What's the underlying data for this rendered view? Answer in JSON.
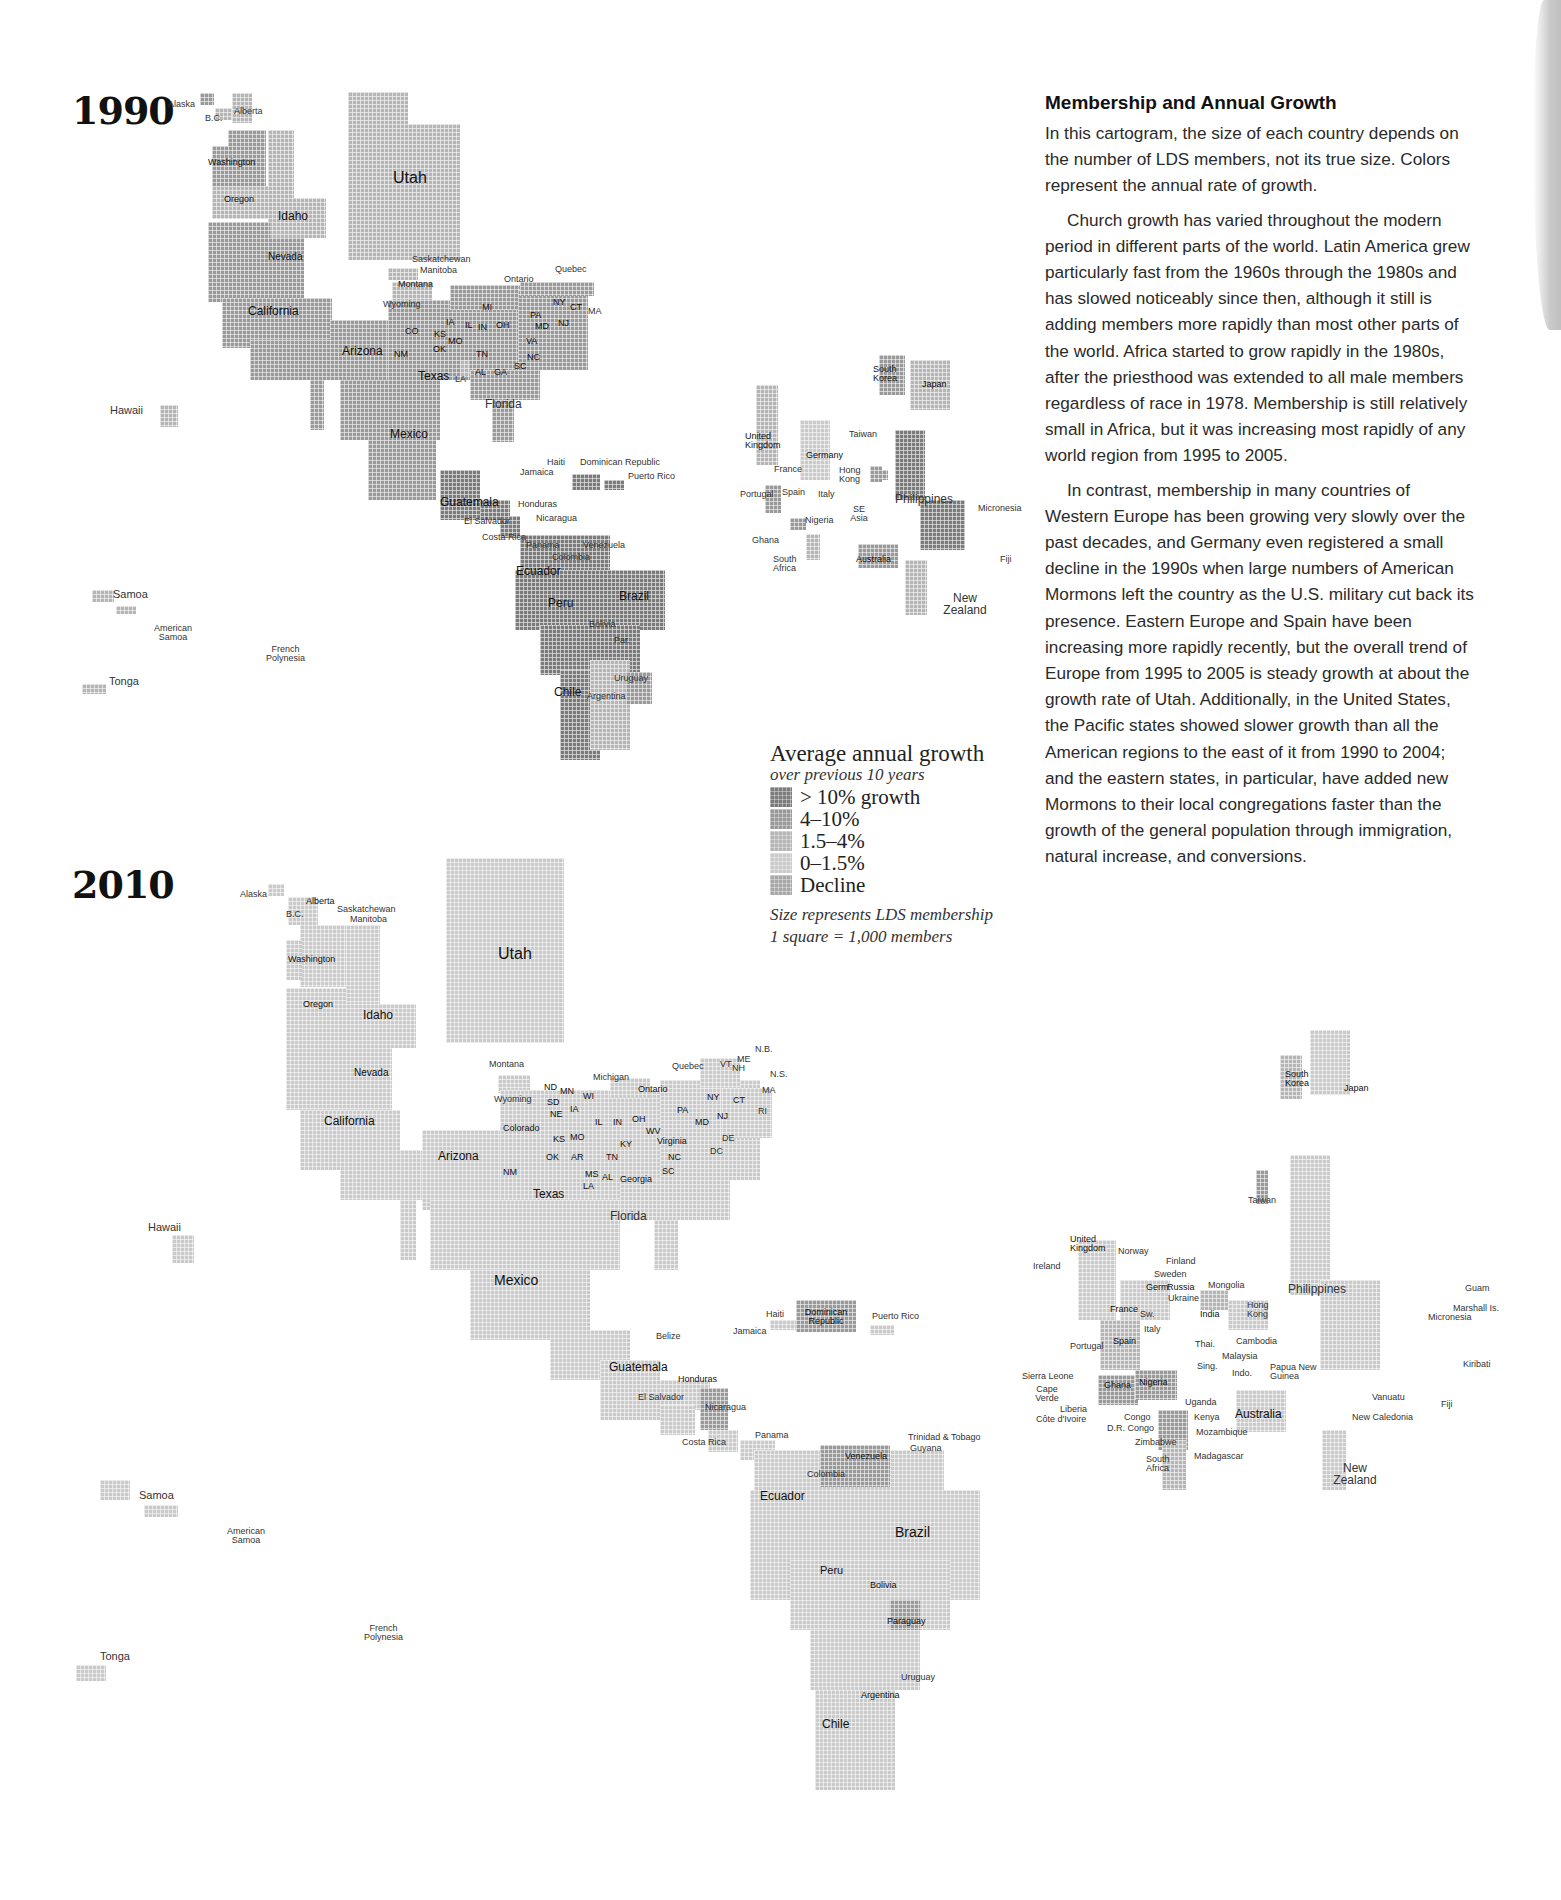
{
  "article": {
    "title": "Membership and Annual Growth",
    "paragraphs": [
      "In this cartogram, the size of each country depends on the number of LDS members, not its true size. Colors represent the annual rate of growth.",
      "Church growth has varied throughout the modern period in different parts of the world. Latin America grew particularly fast from the 1960s through the 1980s and has slowed noticeably since then, although it still is adding members more rapidly than most other parts of the world. Africa started to grow rapidly in the 1980s, after the priesthood was extended to all male members regardless of race in 1978. Membership is still relatively small in Africa, but it was increasing most rapidly of any world region from 1995 to 2005.",
      "In contrast, membership in many countries of Western Europe has been growing very slowly over the past decades, and Germany even registered a small decline in the 1990s when large numbers of American Mormons left the country as the U.S. military cut back its presence. Eastern Europe and Spain have been increasing more rapidly recently, but the overall trend of Europe from 1995 to 2005 is steady growth at about the growth rate of Utah. Additionally, in the United States, the Pacific states showed slower growth than all the American regions to the east of it from 1990 to 2004; and the eastern states, in particular, have added new Mormons to their local congregations faster than the growth of the general population through immigration, natural increase, and conversions."
    ]
  },
  "legend": {
    "title": "Average annual growth",
    "subtitle": "over previous 10 years",
    "classes": [
      {
        "label": "> 10% growth",
        "color": "#7c7c7c"
      },
      {
        "label": "4–10%",
        "color": "#9a9a9a"
      },
      {
        "label": "1.5–4%",
        "color": "#b6b6b6"
      },
      {
        "label": "0–1.5%",
        "color": "#cacaca"
      },
      {
        "label": "Decline",
        "color": "#a8a8a8"
      }
    ],
    "size_note": "Size represents LDS membership",
    "scale_note": "1 square = 1,000 members"
  },
  "maps": {
    "m1990": {
      "year": "1990",
      "labels": {
        "alaska": "Alaska",
        "bc": "B.C.",
        "alberta": "Alberta",
        "washington": "Washington",
        "oregon": "Oregon",
        "idaho": "Idaho",
        "utah": "Utah",
        "nevada": "Nevada",
        "california": "California",
        "arizona": "Arizona",
        "saskatchewan": "Saskatchewan",
        "manitoba": "Manitoba",
        "montana": "Montana",
        "wyoming": "Wyoming",
        "ontario": "Ontario",
        "quebec": "Quebec",
        "co": "CO",
        "nm": "NM",
        "ks": "KS",
        "mo": "MO",
        "ok": "OK",
        "ia": "IA",
        "il": "IL",
        "in": "IN",
        "oh": "OH",
        "mi": "MI",
        "pa": "PA",
        "ny": "NY",
        "ct": "CT",
        "ma": "MA",
        "md": "MD",
        "nj": "NJ",
        "va": "VA",
        "nc": "NC",
        "sc": "SC",
        "tn": "TN",
        "al": "AL",
        "ga": "GA",
        "la": "LA",
        "texas": "Texas",
        "florida": "Florida",
        "mexico": "Mexico",
        "hawaii": "Hawaii",
        "haiti": "Haiti",
        "dominican_republic": "Dominican Republic",
        "jamaica": "Jamaica",
        "puerto_rico": "Puerto Rico",
        "guatemala": "Guatemala",
        "honduras": "Honduras",
        "el_salvador": "El Salvador",
        "nicaragua": "Nicaragua",
        "costa_rica": "Costa Rica",
        "panama": "Panama",
        "venezuela": "Venezuela",
        "colombia": "Colombia",
        "ecuador": "Ecuador",
        "peru": "Peru",
        "brazil": "Brazil",
        "bolivia": "Bolivia",
        "paraguay": "Par.",
        "uruguay": "Uruguay",
        "chile": "Chile",
        "argentina": "Argentina",
        "samoa": "Samoa",
        "american_samoa": "American Samoa",
        "french_polynesia": "French Polynesia",
        "tonga": "Tonga",
        "south_korea": "South Korea",
        "japan": "Japan",
        "united_kingdom": "United Kingdom",
        "taiwan": "Taiwan",
        "germany": "Germany",
        "france": "France",
        "hong_kong": "Hong Kong",
        "portugal": "Portugal",
        "spain": "Spain",
        "italy": "Italy",
        "philippines": "Philippines",
        "micronesia": "Micronesia",
        "se_asia": "SE Asia",
        "nigeria": "Nigeria",
        "ghana": "Ghana",
        "south_africa": "South Africa",
        "australia": "Australia",
        "fiji": "Fiji",
        "new_zealand": "New Zealand"
      }
    },
    "m2010": {
      "year": "2010",
      "labels": {
        "alaska": "Alaska",
        "bc": "B.C.",
        "alberta": "Alberta",
        "saskatchewan": "Saskatchewan",
        "manitoba": "Manitoba",
        "washington": "Washington",
        "oregon": "Oregon",
        "idaho": "Idaho",
        "utah": "Utah",
        "nevada": "Nevada",
        "california": "California",
        "arizona": "Arizona",
        "montana": "Montana",
        "wyoming": "Wyoming",
        "colorado": "Colorado",
        "nm": "NM",
        "texas": "Texas",
        "nd": "ND",
        "sd": "SD",
        "ne": "NE",
        "mn": "MN",
        "wi": "WI",
        "ia": "IA",
        "ks": "KS",
        "mo": "MO",
        "ok": "OK",
        "ar": "AR",
        "ms": "MS",
        "la": "LA",
        "michigan": "Michigan",
        "ontario": "Ontario",
        "quebec": "Quebec",
        "il": "IL",
        "in": "IN",
        "oh": "OH",
        "wv": "WV",
        "ky": "KY",
        "tn": "TN",
        "al": "AL",
        "georgia": "Georgia",
        "virginia": "Virginia",
        "nc": "NC",
        "sc": "SC",
        "pa": "PA",
        "ny": "NY",
        "md": "MD",
        "nj": "NJ",
        "de": "DE",
        "dc": "DC",
        "ct": "CT",
        "ri": "RI",
        "ma": "MA",
        "vt": "VT",
        "nh": "NH",
        "me": "ME",
        "nb": "N.B.",
        "ns": "N.S.",
        "florida": "Florida",
        "mexico": "Mexico",
        "hawaii": "Hawaii",
        "belize": "Belize",
        "guatemala": "Guatemala",
        "honduras": "Honduras",
        "el_salvador": "El Salvador",
        "nicaragua": "Nicaragua",
        "costa_rica": "Costa Rica",
        "panama": "Panama",
        "haiti": "Haiti",
        "dominican_republic": "Dominican Republic",
        "jamaica": "Jamaica",
        "puerto_rico": "Puerto Rico",
        "trinidad_tobago": "Trinidad & Tobago",
        "guyana": "Guyana",
        "venezuela": "Venezuela",
        "colombia": "Colombia",
        "ecuador": "Ecuador",
        "brazil": "Brazil",
        "peru": "Peru",
        "bolivia": "Bolivia",
        "paraguay": "Paraguay",
        "uruguay": "Uruguay",
        "argentina": "Argentina",
        "chile": "Chile",
        "samoa": "Samoa",
        "american_samoa": "American Samoa",
        "french_polynesia": "French Polynesia",
        "tonga": "Tonga",
        "south_korea": "South Korea",
        "japan": "Japan",
        "taiwan": "Taiwan",
        "united_kingdom": "United Kingdom",
        "ireland": "Ireland",
        "norway": "Norway",
        "finland": "Finland",
        "sweden": "Sweden",
        "germany": "Germ.",
        "russia": "Russia",
        "ukraine": "Ukraine",
        "mongolia": "Mongolia",
        "philippines": "Philippines",
        "france": "France",
        "switzerland": "Sw.",
        "india": "India",
        "hong_kong": "Hong Kong",
        "italy": "Italy",
        "portugal": "Portugal",
        "spain": "Spain",
        "thailand": "Thai.",
        "cambodia": "Cambodia",
        "malaysia": "Malaysia",
        "singapore": "Sing.",
        "indonesia": "Indo.",
        "papua_new_guinea": "Papua New Guinea",
        "sierra_leone": "Sierra Leone",
        "cape_verde": "Cape Verde",
        "liberia": "Liberia",
        "cote_divoire": "Côte d'Ivoire",
        "ghana": "Ghana",
        "nigeria": "Nigeria",
        "uganda": "Uganda",
        "kenya": "Kenya",
        "congo": "Congo",
        "dr_congo": "D.R. Congo",
        "mozambique": "Mozambique",
        "zimbabwe": "Zimbabwe",
        "madagascar": "Madagascar",
        "south_africa": "South Africa",
        "australia": "Australia",
        "guam": "Guam",
        "marshall_is": "Marshall Is.",
        "micronesia": "Micronesia",
        "kiribati": "Kiribati",
        "vanuatu": "Vanuatu",
        "new_caledonia": "New Caledonia",
        "fiji": "Fiji",
        "new_zealand": "New Zealand"
      }
    }
  }
}
